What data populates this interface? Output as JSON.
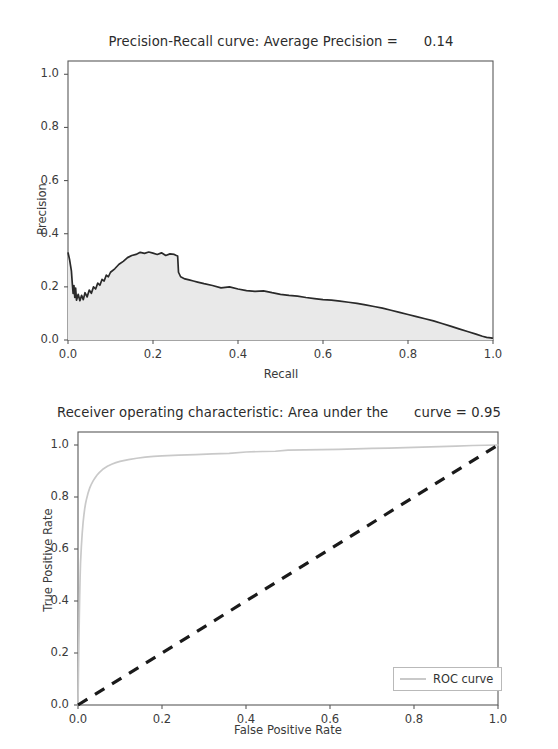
{
  "figure": {
    "background": "#ffffff",
    "width": 558,
    "height": 749
  },
  "panels": {
    "precision_recall": {
      "title": "Precision-Recall curve: Average Precision =      0.14",
      "xlabel": "Recall",
      "ylabel": "Precision",
      "xticks": [
        "0.0",
        "0.2",
        "0.4",
        "0.6",
        "0.8",
        "1.0"
      ],
      "yticks": [
        "1.0",
        "0.8",
        "0.6",
        "0.4",
        "0.2",
        "0.0"
      ]
    },
    "roc": {
      "title": "Receiver operating characteristic: Area under the      curve = 0.95",
      "xlabel": "False Positive Rate",
      "ylabel": "True Positive Rate",
      "xticks": [
        "0.0",
        "0.2",
        "0.4",
        "0.6",
        "0.8",
        "1.0"
      ],
      "yticks": [
        "1.0",
        "0.8",
        "0.6",
        "0.4",
        "0.2",
        "0.0"
      ],
      "legend": {
        "entry_label": "ROC curve",
        "swatch_color": "#c9c9c9"
      }
    }
  },
  "chart_data": [
    {
      "type": "area",
      "id": "precision-recall",
      "title": "Precision-Recall curve: Average Precision =      0.14",
      "xlabel": "Recall",
      "ylabel": "Precision",
      "xlim": [
        0.0,
        1.0
      ],
      "ylim": [
        0.0,
        1.05
      ],
      "xticks": [
        0.0,
        0.2,
        0.4,
        0.6,
        0.8,
        1.0
      ],
      "yticks": [
        0.0,
        0.2,
        0.4,
        0.6,
        0.8,
        1.0
      ],
      "grid": false,
      "legend": null,
      "annotations": [
        "Average Precision = 0.14"
      ],
      "line_color": "#2a2a2a",
      "fill_color": "#e9e9e9",
      "series": [
        {
          "name": "Precision-Recall",
          "x": [
            0.0,
            0.004,
            0.008,
            0.01,
            0.012,
            0.014,
            0.016,
            0.018,
            0.02,
            0.024,
            0.028,
            0.032,
            0.036,
            0.04,
            0.045,
            0.05,
            0.055,
            0.06,
            0.065,
            0.07,
            0.075,
            0.08,
            0.085,
            0.09,
            0.095,
            0.1,
            0.11,
            0.12,
            0.13,
            0.14,
            0.15,
            0.16,
            0.17,
            0.18,
            0.19,
            0.2,
            0.21,
            0.22,
            0.23,
            0.24,
            0.25,
            0.255,
            0.258,
            0.26,
            0.265,
            0.275,
            0.285,
            0.295,
            0.305,
            0.32,
            0.34,
            0.36,
            0.38,
            0.4,
            0.42,
            0.44,
            0.46,
            0.48,
            0.5,
            0.52,
            0.54,
            0.56,
            0.58,
            0.6,
            0.62,
            0.64,
            0.66,
            0.68,
            0.7,
            0.72,
            0.74,
            0.76,
            0.78,
            0.8,
            0.82,
            0.84,
            0.86,
            0.88,
            0.9,
            0.92,
            0.94,
            0.96,
            0.975,
            0.985,
            0.995,
            1.0
          ],
          "y": [
            0.33,
            0.3,
            0.26,
            0.215,
            0.175,
            0.205,
            0.16,
            0.195,
            0.15,
            0.172,
            0.148,
            0.168,
            0.152,
            0.178,
            0.162,
            0.188,
            0.176,
            0.2,
            0.192,
            0.214,
            0.206,
            0.228,
            0.222,
            0.244,
            0.238,
            0.255,
            0.268,
            0.285,
            0.296,
            0.31,
            0.318,
            0.322,
            0.33,
            0.326,
            0.331,
            0.327,
            0.322,
            0.328,
            0.318,
            0.324,
            0.322,
            0.318,
            0.316,
            0.255,
            0.238,
            0.23,
            0.226,
            0.222,
            0.218,
            0.212,
            0.205,
            0.196,
            0.2,
            0.192,
            0.186,
            0.183,
            0.185,
            0.178,
            0.172,
            0.168,
            0.165,
            0.16,
            0.156,
            0.152,
            0.15,
            0.146,
            0.142,
            0.138,
            0.132,
            0.126,
            0.12,
            0.112,
            0.104,
            0.096,
            0.088,
            0.08,
            0.072,
            0.062,
            0.052,
            0.042,
            0.032,
            0.022,
            0.014,
            0.01,
            0.008,
            0.006
          ]
        }
      ]
    },
    {
      "type": "line",
      "id": "roc",
      "title": "Receiver operating characteristic: Area under the      curve = 0.95",
      "xlabel": "False Positive Rate",
      "ylabel": "True Positive Rate",
      "xlim": [
        0.0,
        1.0
      ],
      "ylim": [
        0.0,
        1.05
      ],
      "xticks": [
        0.0,
        0.2,
        0.4,
        0.6,
        0.8,
        1.0
      ],
      "yticks": [
        0.0,
        0.2,
        0.4,
        0.6,
        0.8,
        1.0
      ],
      "grid": false,
      "legend": {
        "position": "lower right",
        "entries": [
          "ROC curve"
        ]
      },
      "annotations": [
        "Area under the curve = 0.95"
      ],
      "series": [
        {
          "name": "ROC curve",
          "color": "#c9c9c9",
          "style": "solid",
          "x": [
            0.0,
            0.001,
            0.002,
            0.003,
            0.004,
            0.005,
            0.006,
            0.008,
            0.01,
            0.012,
            0.014,
            0.016,
            0.018,
            0.02,
            0.024,
            0.028,
            0.032,
            0.036,
            0.04,
            0.045,
            0.05,
            0.06,
            0.07,
            0.08,
            0.09,
            0.1,
            0.12,
            0.14,
            0.16,
            0.18,
            0.2,
            0.24,
            0.28,
            0.32,
            0.36,
            0.4,
            0.44,
            0.47,
            0.5,
            0.54,
            0.58,
            0.62,
            0.66,
            0.7,
            0.74,
            0.78,
            0.82,
            0.86,
            0.9,
            0.94,
            0.97,
            1.0
          ],
          "y": [
            0.0,
            0.12,
            0.23,
            0.33,
            0.42,
            0.49,
            0.545,
            0.61,
            0.66,
            0.7,
            0.73,
            0.755,
            0.775,
            0.79,
            0.815,
            0.835,
            0.85,
            0.862,
            0.872,
            0.884,
            0.893,
            0.908,
            0.918,
            0.926,
            0.932,
            0.937,
            0.944,
            0.949,
            0.953,
            0.956,
            0.958,
            0.961,
            0.963,
            0.966,
            0.968,
            0.973,
            0.975,
            0.976,
            0.98,
            0.981,
            0.982,
            0.983,
            0.985,
            0.987,
            0.988,
            0.99,
            0.992,
            0.994,
            0.996,
            0.998,
            0.999,
            1.0
          ]
        },
        {
          "name": "chance",
          "color": "#1a1a1a",
          "style": "dashed",
          "x": [
            0.0,
            1.0
          ],
          "y": [
            0.0,
            1.0
          ]
        }
      ]
    }
  ]
}
